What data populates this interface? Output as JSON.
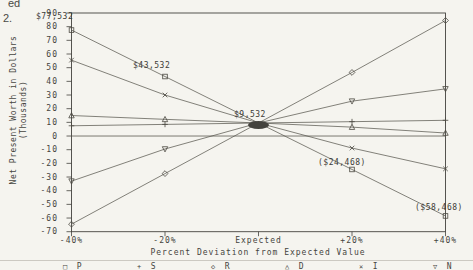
{
  "page": {
    "margin_fragments": {
      "fragment_top": "ed",
      "fragment_bottom": "2."
    }
  },
  "chart_data": {
    "type": "line",
    "title": "",
    "xlabel": "Percent Deviation from Expected Value",
    "ylabel": "Net Present Worth in Dollars",
    "ylabel_units": "(Thousands)",
    "x_pct": [
      -40,
      -20,
      0,
      20,
      40
    ],
    "x_tick_labels": [
      "-40%",
      "-20%",
      "Expected",
      "+20%",
      "+40%"
    ],
    "y_tick_labels": [
      "90",
      "80",
      "70",
      "60",
      "50",
      "40",
      "30",
      "20",
      "10",
      "0",
      "-10",
      "-20",
      "-30",
      "-40",
      "-50",
      "-60",
      "-70"
    ],
    "y_ticks": [
      90,
      80,
      70,
      60,
      50,
      40,
      30,
      20,
      10,
      0,
      -10,
      -20,
      -30,
      -40,
      -50,
      -60,
      -70
    ],
    "ylim": [
      -70,
      90
    ],
    "grid": false,
    "zero_reference_line": true,
    "expected_value_crossing": 9.532,
    "series": [
      {
        "name": "P",
        "marker": "square",
        "values": [
          77.532,
          43.532,
          9.532,
          -24.468,
          -58.468
        ]
      },
      {
        "name": "S",
        "marker": "plus",
        "values": [
          7.5,
          8.5,
          9.532,
          10.5,
          11.5
        ]
      },
      {
        "name": "R",
        "marker": "diamond",
        "values": [
          -64.5,
          -27.5,
          9.532,
          46.5,
          84.5
        ]
      },
      {
        "name": "D",
        "marker": "triangle-up",
        "values": [
          15.0,
          12.2,
          9.532,
          6.5,
          2.2
        ]
      },
      {
        "name": "I",
        "marker": "x",
        "values": [
          55.5,
          30.0,
          9.532,
          -8.8,
          -24.0
        ]
      },
      {
        "name": "N",
        "marker": "triangle-down",
        "values": [
          -33.0,
          -9.5,
          9.532,
          25.5,
          34.5
        ]
      }
    ],
    "annotations": [
      {
        "text": "$77,532",
        "x_pct": -40,
        "value": 77.532
      },
      {
        "text": "$43,532",
        "x_pct": -20,
        "value": 43.532
      },
      {
        "text": "$9,532",
        "x_pct": 0,
        "value": 9.532
      },
      {
        "text": "($24,468)",
        "x_pct": 20,
        "value": -24.468
      },
      {
        "text": "($58,468)",
        "x_pct": 40,
        "value": -58.468
      }
    ],
    "legend_position": "bottom",
    "legend": [
      {
        "marker": "square",
        "glyph": "□",
        "label": "P"
      },
      {
        "marker": "plus",
        "glyph": "+",
        "label": "S"
      },
      {
        "marker": "diamond",
        "glyph": "◇",
        "label": "R"
      },
      {
        "marker": "triangle-up",
        "glyph": "△",
        "label": "D"
      },
      {
        "marker": "x",
        "glyph": "×",
        "label": "I"
      },
      {
        "marker": "triangle-down",
        "glyph": "▽",
        "label": "N"
      }
    ]
  },
  "colors": {
    "paper": "#f5f4ef",
    "axis_ink": "#44433e",
    "line_ink": "#5c5a52",
    "marker_ink": "#4a4840",
    "text_ink": "#45443e"
  }
}
